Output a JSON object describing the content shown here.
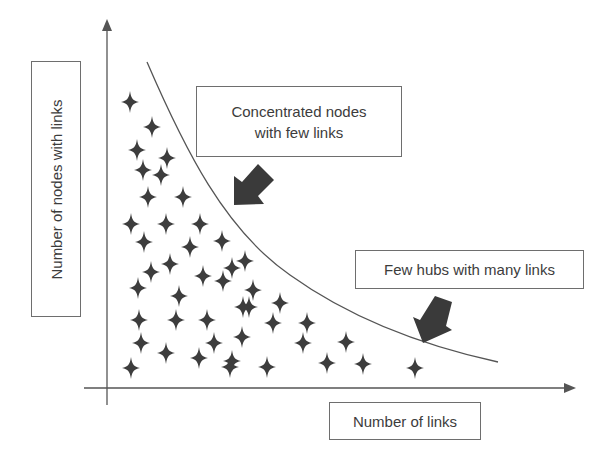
{
  "diagram": {
    "type": "long-tail-distribution-schematic",
    "colors": {
      "axis": "#555555",
      "curve": "#555555",
      "star": "#3d3d3d",
      "arrow": "#3a3a3a",
      "box_border": "#6e6e6e",
      "text": "#3c3c3c"
    },
    "y_axis_label": "Number of nodes with links",
    "x_axis_label": "Number of links",
    "annotations": [
      {
        "id": "concentrated",
        "text_line1": "Concentrated nodes",
        "text_line2": "with few links",
        "arrow_direction": "down-left"
      },
      {
        "id": "hubs",
        "text": "Few hubs with many links",
        "arrow_direction": "down-left"
      }
    ],
    "nodes_icon": "four-point-star-icon",
    "node_points": [
      [
        130,
        102
      ],
      [
        152,
        127
      ],
      [
        137,
        150
      ],
      [
        167,
        158
      ],
      [
        143,
        170
      ],
      [
        161,
        175
      ],
      [
        148,
        197
      ],
      [
        183,
        197
      ],
      [
        131,
        224
      ],
      [
        166,
        224
      ],
      [
        200,
        224
      ],
      [
        144,
        242
      ],
      [
        190,
        247
      ],
      [
        222,
        241
      ],
      [
        151,
        272
      ],
      [
        170,
        264
      ],
      [
        203,
        276
      ],
      [
        138,
        288
      ],
      [
        179,
        296
      ],
      [
        223,
        281
      ],
      [
        232,
        268
      ],
      [
        245,
        261
      ],
      [
        253,
        290
      ],
      [
        249,
        307
      ],
      [
        139,
        320
      ],
      [
        176,
        320
      ],
      [
        207,
        320
      ],
      [
        243,
        307
      ],
      [
        141,
        343
      ],
      [
        166,
        353
      ],
      [
        214,
        343
      ],
      [
        242,
        337
      ],
      [
        280,
        303
      ],
      [
        273,
        323
      ],
      [
        307,
        323
      ],
      [
        303,
        343
      ],
      [
        346,
        342
      ],
      [
        131,
        368
      ],
      [
        199,
        358
      ],
      [
        232,
        361
      ],
      [
        230,
        367
      ],
      [
        267,
        367
      ],
      [
        327,
        363
      ],
      [
        363,
        364
      ],
      [
        415,
        368
      ]
    ]
  }
}
